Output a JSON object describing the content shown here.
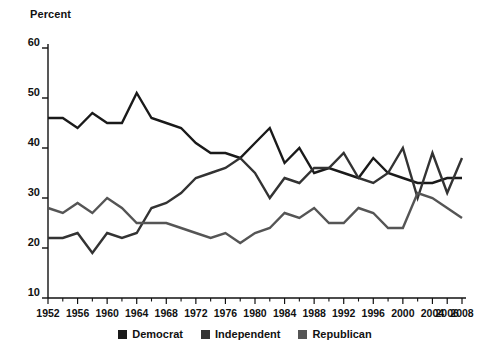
{
  "chart_data": {
    "type": "line",
    "title": "",
    "subtitle": "",
    "xlabel": "",
    "ylabel": "Percent",
    "ylim": [
      10,
      60
    ],
    "xlim": [
      1952,
      2008
    ],
    "y_ticks": [
      10,
      20,
      30,
      40,
      50,
      60
    ],
    "x_ticks": [
      1952,
      1956,
      1960,
      1964,
      1968,
      1972,
      1976,
      1980,
      1984,
      1988,
      1992,
      1996,
      2000,
      2004,
      2006,
      2008
    ],
    "x_tick_labels": [
      "1952",
      "1956",
      "1960",
      "1964",
      "1968",
      "1972",
      "1976",
      "1980",
      "1984",
      "1988",
      "1992",
      "1996",
      "2000",
      "2004",
      "2006",
      "2008"
    ],
    "x_minor_ticks": [
      1954,
      1958,
      1962,
      1966,
      1970,
      1974,
      1978,
      1982,
      1986,
      1990,
      1994,
      1998,
      2002
    ],
    "grid": false,
    "legend_position": "bottom",
    "x": [
      1952,
      1954,
      1956,
      1958,
      1960,
      1962,
      1964,
      1966,
      1968,
      1970,
      1972,
      1974,
      1976,
      1978,
      1980,
      1982,
      1984,
      1986,
      1988,
      1990,
      1992,
      1994,
      1996,
      1998,
      2000,
      2002,
      2004,
      2006,
      2008
    ],
    "series": [
      {
        "name": "Democrat",
        "color": "#1a1a1a",
        "values": [
          46,
          46,
          44,
          47,
          45,
          45,
          51,
          46,
          45,
          44,
          41,
          39,
          39,
          38,
          41,
          44,
          37,
          40,
          35,
          36,
          35,
          34,
          38,
          35,
          34,
          33,
          33,
          34,
          34
        ]
      },
      {
        "name": "Independent",
        "color": "#333333",
        "values": [
          22,
          22,
          23,
          19,
          23,
          22,
          23,
          28,
          29,
          31,
          34,
          35,
          36,
          38,
          35,
          30,
          34,
          33,
          36,
          36,
          39,
          34,
          33,
          35,
          40,
          30,
          39,
          31,
          38
        ]
      },
      {
        "name": "Republican",
        "color": "#555555",
        "values": [
          28,
          27,
          29,
          27,
          30,
          28,
          25,
          25,
          25,
          24,
          23,
          22,
          23,
          21,
          23,
          24,
          27,
          26,
          28,
          25,
          25,
          28,
          27,
          24,
          24,
          31,
          30,
          28,
          26
        ]
      }
    ]
  },
  "legend": {
    "items": [
      {
        "label": "Democrat",
        "color": "#1a1a1a"
      },
      {
        "label": "Independent",
        "color": "#333333"
      },
      {
        "label": "Republican",
        "color": "#555555"
      }
    ]
  },
  "axis": {
    "y_title": "Percent"
  }
}
